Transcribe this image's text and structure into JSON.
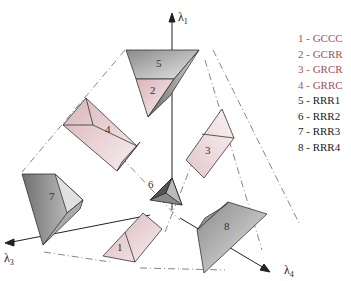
{
  "figure": {
    "axes": [
      {
        "id": "lambda1",
        "label": "λ",
        "sub": "1"
      },
      {
        "id": "lambda3",
        "label": "λ",
        "sub": "3"
      },
      {
        "id": "lambda4",
        "label": "λ",
        "sub": "4"
      }
    ],
    "shapes": [
      {
        "num": "1",
        "color": "pink"
      },
      {
        "num": "2",
        "color": "pink"
      },
      {
        "num": "3",
        "color": "pink"
      },
      {
        "num": "4",
        "color": "pink"
      },
      {
        "num": "5",
        "color": "gray"
      },
      {
        "num": "6",
        "color": "gray"
      },
      {
        "num": "7",
        "color": "gray"
      },
      {
        "num": "8",
        "color": "gray"
      }
    ],
    "legend": [
      {
        "text": "1 - GCCC",
        "color": "#a0525a"
      },
      {
        "text": "2 - GCRR",
        "color": "#a0525a"
      },
      {
        "text": "3 - GRCR",
        "color": "#a0525a"
      },
      {
        "text": "4 - GRRC",
        "color": "#a0525a"
      },
      {
        "text": "5 - RRR1",
        "color": "#222222"
      },
      {
        "text": "6 - RRR2",
        "color": "#222222"
      },
      {
        "text": "7 - RRR3",
        "color": "#222222"
      },
      {
        "text": "8 - RRR4",
        "color": "#222222"
      }
    ]
  }
}
